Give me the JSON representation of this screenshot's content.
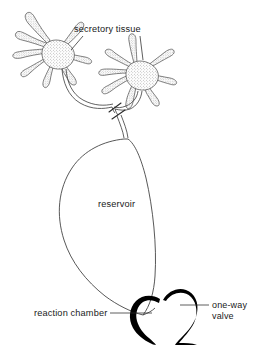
{
  "figure": {
    "kind": "biological-anatomy-diagram",
    "background_color": "#ffffff",
    "ink_color": "#000000",
    "outline_color": "#3a3a3a",
    "width": 271,
    "height": 359
  },
  "labels": {
    "secretory_tissue": "secretory tissue",
    "reservoir": "reservoir",
    "reaction_chamber": "reaction chamber",
    "one_way_valve_line1": "one-way",
    "one_way_valve_line2": "valve"
  },
  "parts": [
    {
      "id": "secretory-tissue-left",
      "label": "secretory tissue",
      "description": "stippled multi-lobed gland, upper left",
      "lobe_count": 8
    },
    {
      "id": "secretory-tissue-right",
      "label": "secretory tissue",
      "description": "stippled multi-lobed gland, upper right",
      "lobe_count": 8
    },
    {
      "id": "collecting-duct",
      "label": "",
      "description": "paired thin ducts merging into single duct with break marks"
    },
    {
      "id": "reservoir",
      "label": "reservoir",
      "description": "large teardrop shaped sac"
    },
    {
      "id": "one-way-valve",
      "label": "one-way valve",
      "description": "thick black curved stroke at reservoir outlet"
    },
    {
      "id": "reaction-chamber",
      "label": "reaction chamber",
      "description": "thick black curved stroke forming cup below reservoir"
    }
  ]
}
